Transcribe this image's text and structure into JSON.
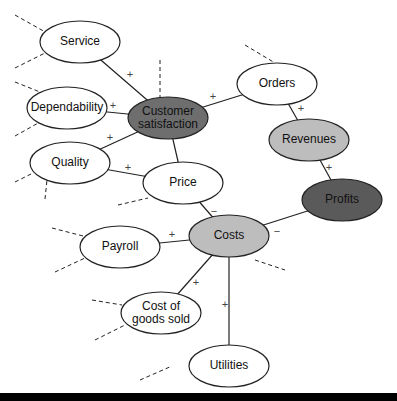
{
  "diagram": {
    "nodes": [
      {
        "id": "service",
        "lines": [
          "Service"
        ],
        "fill": "#ffffff"
      },
      {
        "id": "dependability",
        "lines": [
          "Dependability"
        ],
        "fill": "#ffffff"
      },
      {
        "id": "customer-satisfaction",
        "lines": [
          "Customer",
          "satisfaction"
        ],
        "fill": "#6e6e6e"
      },
      {
        "id": "quality",
        "lines": [
          "Quality"
        ],
        "fill": "#ffffff"
      },
      {
        "id": "price",
        "lines": [
          "Price"
        ],
        "fill": "#ffffff"
      },
      {
        "id": "orders",
        "lines": [
          "Orders"
        ],
        "fill": "#ffffff"
      },
      {
        "id": "revenues",
        "lines": [
          "Revenues"
        ],
        "fill": "#bdbdbd"
      },
      {
        "id": "profits",
        "lines": [
          "Profits"
        ],
        "fill": "#5a5a5a"
      },
      {
        "id": "costs",
        "lines": [
          "Costs"
        ],
        "fill": "#bdbdbd"
      },
      {
        "id": "payroll",
        "lines": [
          "Payroll"
        ],
        "fill": "#ffffff"
      },
      {
        "id": "cost-of-goods-sold",
        "lines": [
          "Cost of",
          "goods sold"
        ],
        "fill": "#ffffff"
      },
      {
        "id": "utilities",
        "lines": [
          "Utilities"
        ],
        "fill": "#ffffff"
      }
    ],
    "edges": [
      {
        "from": "service",
        "to": "customer-satisfaction",
        "sign": "+"
      },
      {
        "from": "dependability",
        "to": "customer-satisfaction",
        "sign": "+"
      },
      {
        "from": "quality",
        "to": "customer-satisfaction",
        "sign": "+"
      },
      {
        "from": "quality",
        "to": "price",
        "sign": "+"
      },
      {
        "from": "price",
        "to": "customer-satisfaction",
        "sign": ""
      },
      {
        "from": "customer-satisfaction",
        "to": "orders",
        "sign": "+"
      },
      {
        "from": "orders",
        "to": "revenues",
        "sign": "+"
      },
      {
        "from": "revenues",
        "to": "profits",
        "sign": "+"
      },
      {
        "from": "price",
        "to": "costs",
        "sign": "−"
      },
      {
        "from": "costs",
        "to": "profits",
        "sign": "−"
      },
      {
        "from": "payroll",
        "to": "costs",
        "sign": "+"
      },
      {
        "from": "cost-of-goods-sold",
        "to": "costs",
        "sign": "+"
      },
      {
        "from": "utilities",
        "to": "costs",
        "sign": "+"
      }
    ]
  }
}
